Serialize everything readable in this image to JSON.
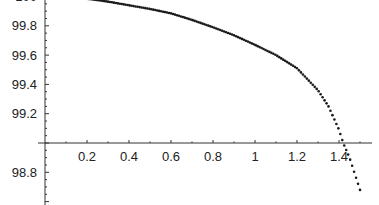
{
  "chart_data": {
    "type": "scatter",
    "title": "",
    "xlabel": "",
    "ylabel": "",
    "x_ticks": [
      "0.2",
      "0.4",
      "0.6",
      "0.8",
      "1",
      "1.2",
      "1.4"
    ],
    "y_ticks": [
      "100",
      "99.8",
      "99.6",
      "99.4",
      "99.2",
      "98.8"
    ],
    "axis_origin": {
      "x": 0,
      "y": 99.0
    },
    "xlim": [
      0,
      1.52
    ],
    "ylim": [
      98.65,
      100.01
    ],
    "grid": false,
    "legend": null,
    "series": [
      {
        "name": "curve",
        "marker": "dot",
        "color": "#1a1a1a",
        "x": [
          0.0,
          0.1,
          0.2,
          0.3,
          0.4,
          0.5,
          0.6,
          0.7,
          0.8,
          0.9,
          1.0,
          1.1,
          1.2,
          1.3,
          1.35,
          1.4,
          1.42,
          1.45,
          1.5
        ],
        "y": [
          100.0,
          99.995,
          99.985,
          99.965,
          99.94,
          99.915,
          99.885,
          99.84,
          99.79,
          99.735,
          99.67,
          99.6,
          99.51,
          99.36,
          99.25,
          99.09,
          99.0,
          98.9,
          98.68
        ]
      }
    ]
  }
}
